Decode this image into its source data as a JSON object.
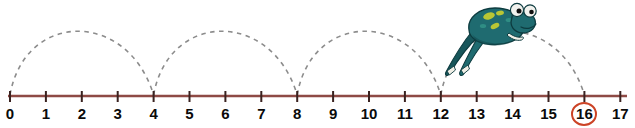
{
  "diagram": {
    "kind": "number-line-skip-counting",
    "number_line": {
      "min": 0,
      "max": 17,
      "tick_labels": [
        "0",
        "1",
        "2",
        "3",
        "4",
        "5",
        "6",
        "7",
        "8",
        "9",
        "10",
        "11",
        "12",
        "13",
        "14",
        "15",
        "16",
        "17"
      ],
      "axis_color": "#8e4a45",
      "tick_color": "#3a2220",
      "label_color": "#0a0a0a",
      "start_x": 10,
      "unit_px": 35.9,
      "baseline_y": 96
    },
    "jumps": {
      "step": 4,
      "count": 4,
      "starts": [
        0,
        4,
        8,
        12
      ],
      "ends": [
        4,
        8,
        12,
        16
      ],
      "arc_height": 84,
      "stroke_color": "#8c8c8c",
      "dashed": true
    },
    "highlight": {
      "value": "16",
      "index": 16,
      "ring_color": "#cc4326",
      "shape": "ellipse"
    },
    "frog": {
      "label": "jumping-frog",
      "facing": "right",
      "body_color": "#1f6b70",
      "body_shade": "#12484d",
      "spot_color": "#b9c634",
      "eye_white": "#f2f2ee",
      "eye_pupil": "#111111",
      "outline_color": "#0d3b3f",
      "position_over": "12-to-16-arc"
    }
  }
}
